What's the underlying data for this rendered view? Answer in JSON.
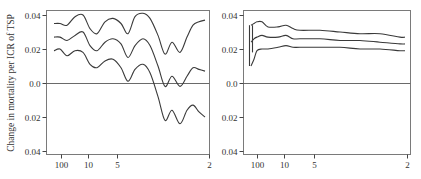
{
  "chart_data": [
    {
      "type": "line",
      "panel": "left",
      "title": "",
      "ylabel": "Change in mortality per ICR of TSP",
      "xlabel": "",
      "ylim": [
        -0.04,
        0.04
      ],
      "yticks": [
        0.04,
        0.02,
        0.0,
        -0.02,
        -0.04
      ],
      "ytick_labels": [
        "0.04",
        "0.02",
        "0.0",
        "0.02",
        "0.04"
      ],
      "xticks": [
        100,
        10,
        5,
        2
      ],
      "xtick_labels": [
        "100",
        "10",
        "5",
        "2"
      ],
      "x_scale": "reversed (degrees of freedom / smoothing span)",
      "grid": false,
      "legend": null,
      "reference_line": 0.0,
      "x_pixel": [
        54,
        60,
        67,
        75,
        83,
        90,
        97,
        105,
        113,
        121,
        128,
        135,
        143,
        150,
        158,
        165,
        172,
        180,
        187,
        193,
        199,
        205
      ],
      "series": [
        {
          "name": "upper bound",
          "values": [
            0.035,
            0.035,
            0.034,
            0.039,
            0.04,
            0.032,
            0.029,
            0.036,
            0.038,
            0.035,
            0.029,
            0.039,
            0.041,
            0.038,
            0.028,
            0.017,
            0.024,
            0.018,
            0.027,
            0.034,
            0.036,
            0.037
          ]
        },
        {
          "name": "estimate",
          "values": [
            0.027,
            0.027,
            0.025,
            0.028,
            0.03,
            0.022,
            0.019,
            0.024,
            0.026,
            0.023,
            0.015,
            0.022,
            0.026,
            0.022,
            0.01,
            -0.002,
            0.004,
            -0.002,
            0.004,
            0.009,
            0.008,
            0.007
          ]
        },
        {
          "name": "lower bound",
          "values": [
            0.019,
            0.02,
            0.016,
            0.019,
            0.018,
            0.011,
            0.009,
            0.013,
            0.014,
            0.009,
            0.001,
            0.008,
            0.011,
            0.006,
            -0.008,
            -0.022,
            -0.016,
            -0.024,
            -0.016,
            -0.013,
            -0.017,
            -0.02
          ]
        }
      ]
    },
    {
      "type": "line",
      "panel": "right",
      "title": "",
      "ylabel": "",
      "xlabel": "",
      "ylim": [
        -0.04,
        0.04
      ],
      "yticks": [
        0.04,
        0.02,
        0.0,
        -0.02,
        -0.04
      ],
      "ytick_labels": [
        "0.04",
        "0.02",
        "0.0",
        "0.02",
        "0.04"
      ],
      "xticks": [
        100,
        10,
        5,
        2
      ],
      "xtick_labels": [
        "100",
        "10",
        "5",
        "2"
      ],
      "x_scale": "reversed (degrees of freedom / smoothing span)",
      "grid": false,
      "legend": null,
      "reference_line": 0.0,
      "x_pixel": [
        251,
        254,
        257,
        262,
        268,
        278,
        286,
        293,
        300,
        320,
        340,
        360,
        380,
        400,
        405
      ],
      "series": [
        {
          "name": "upper bound",
          "values": [
            0.034,
            0.035,
            0.036,
            0.036,
            0.033,
            0.033,
            0.034,
            0.032,
            0.031,
            0.031,
            0.03,
            0.029,
            0.029,
            0.027,
            0.027
          ]
        },
        {
          "name": "estimate",
          "values": [
            0.024,
            0.026,
            0.027,
            0.028,
            0.027,
            0.027,
            0.028,
            0.026,
            0.026,
            0.026,
            0.025,
            0.025,
            0.024,
            0.023,
            0.023
          ]
        },
        {
          "name": "lower bound",
          "values": [
            0.01,
            0.014,
            0.019,
            0.02,
            0.02,
            0.021,
            0.022,
            0.021,
            0.021,
            0.021,
            0.021,
            0.02,
            0.02,
            0.019,
            0.019
          ]
        }
      ],
      "left_edge_spikes": [
        {
          "x_pixel": 249,
          "from": 0.01,
          "to": 0.034
        },
        {
          "x_pixel": 252,
          "from": 0.018,
          "to": 0.034
        }
      ]
    }
  ]
}
